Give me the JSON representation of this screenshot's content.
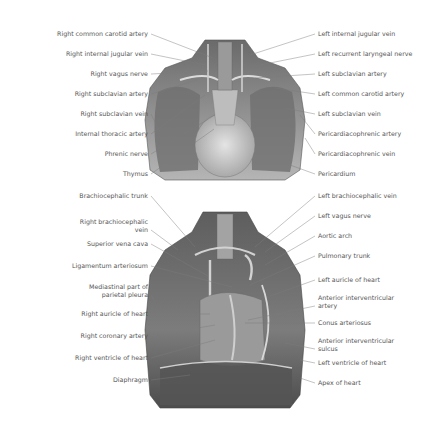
{
  "figures": [
    {
      "id": "top",
      "description": "Anterior view of thorax with thymus and pericardium",
      "left_labels": [
        {
          "text": "Right common carotid artery",
          "y": 34,
          "tx": 213,
          "ty": 58
        },
        {
          "text": "Right internal jugular vein",
          "y": 54,
          "tx": 205,
          "ty": 65
        },
        {
          "text": "Right vagus nerve",
          "y": 74,
          "tx": 208,
          "ty": 71
        },
        {
          "text": "Right subclavian artery",
          "y": 94,
          "tx": 197,
          "ty": 80
        },
        {
          "text": "Right subclavian vein",
          "y": 114,
          "tx": 160,
          "ty": 132
        },
        {
          "text": "Internal thoracic artery",
          "y": 134,
          "tx": 205,
          "ty": 95
        },
        {
          "text": "Phrenic nerve",
          "y": 154,
          "tx": 215,
          "ty": 115
        },
        {
          "text": "Thymus",
          "y": 174,
          "tx": 214,
          "ty": 129
        }
      ],
      "right_labels": [
        {
          "text": "Left internal jugular vein",
          "y": 34,
          "tx": 250,
          "ty": 55
        },
        {
          "text": "Left recurrent laryngeal nerve",
          "y": 54,
          "tx": 255,
          "ty": 66
        },
        {
          "text": "Left subclavian artery",
          "y": 74,
          "tx": 255,
          "ty": 78
        },
        {
          "text": "Left common carotid artery",
          "y": 94,
          "tx": 275,
          "ty": 88
        },
        {
          "text": "Left subclavian vein",
          "y": 114,
          "tx": 285,
          "ty": 108
        },
        {
          "text": "Pericardiacophrenic artery",
          "y": 134,
          "tx": 300,
          "ty": 115
        },
        {
          "text": "Pericardiacophrenic vein",
          "y": 154,
          "tx": 305,
          "ty": 138
        },
        {
          "text": "Pericardium",
          "y": 174,
          "tx": 290,
          "ty": 165
        }
      ]
    },
    {
      "id": "bottom",
      "description": "Anterior view of thorax with heart exposed",
      "left_labels": [
        {
          "text": "Brachiocephalic trunk",
          "y": 196,
          "tx": 195,
          "ty": 247
        },
        {
          "text": "Right brachiocephalic vein",
          "lines": [
            "Right brachiocephalic",
            "vein"
          ],
          "y": 226,
          "tx": 178,
          "ty": 250
        },
        {
          "text": "Superior vena cava",
          "y": 244,
          "tx": 208,
          "ty": 276
        },
        {
          "text": "Ligamentum arteriosum",
          "y": 266,
          "tx": 232,
          "ty": 287
        },
        {
          "text": "Mediastinal part of parietal pleura",
          "lines": [
            "Mediastinal part of",
            "parietal pleura"
          ],
          "y": 291,
          "tx": 154,
          "ty": 300
        },
        {
          "text": "Right auricle of heart",
          "y": 314,
          "tx": 210,
          "ty": 314
        },
        {
          "text": "Right coronary artery",
          "y": 336,
          "tx": 215,
          "ty": 325
        },
        {
          "text": "Right ventricle of heart",
          "y": 358,
          "tx": 215,
          "ty": 340
        },
        {
          "text": "Diaphragm",
          "y": 380,
          "tx": 190,
          "ty": 375
        }
      ],
      "right_labels": [
        {
          "text": "Left brachiocephalic vein",
          "y": 196,
          "tx": 255,
          "ty": 247
        },
        {
          "text": "Left vagus nerve",
          "y": 216,
          "tx": 265,
          "ty": 252
        },
        {
          "text": "Aortic arch",
          "y": 236,
          "tx": 265,
          "ty": 265
        },
        {
          "text": "Pulmonary trunk",
          "y": 256,
          "tx": 250,
          "ty": 285
        },
        {
          "text": "Left auricle of heart",
          "y": 280,
          "tx": 270,
          "ty": 296
        },
        {
          "text": "Anterior interventricular artery",
          "lines": [
            "Anterior interventricular",
            "artery"
          ],
          "y": 302,
          "tx": 248,
          "ty": 320
        },
        {
          "text": "Conus arteriosus",
          "y": 323,
          "tx": 245,
          "ty": 323
        },
        {
          "text": "Anterior interventricular sulcus",
          "lines": [
            "Anterior interventricular",
            "sulcus"
          ],
          "y": 345,
          "tx": 285,
          "ty": 343
        },
        {
          "text": "Left ventricle of heart",
          "y": 363,
          "tx": 300,
          "ty": 360
        },
        {
          "text": "Apex of heart",
          "y": 383,
          "tx": 300,
          "ty": 378
        }
      ]
    }
  ],
  "colors": {
    "label_text": "#555555",
    "leader_line": "#7a7a7a",
    "illustration_dark": "#4a4a4a",
    "illustration_mid": "#8c8c8c",
    "illustration_light": "#d8d8d8"
  }
}
